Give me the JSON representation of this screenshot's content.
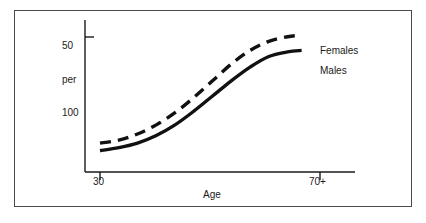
{
  "chart_data": {
    "type": "line",
    "title": "",
    "xlabel": "Age",
    "ylabel": "50 per 100",
    "ylabel_lines": [
      "50",
      "per",
      "100"
    ],
    "xtick_labels": [
      "30",
      "70+"
    ],
    "ytick_labels": [
      "50 per 100"
    ],
    "grid": false,
    "legend_position": "right-inline",
    "xlim": [
      30,
      75
    ],
    "ylim": [
      0,
      100
    ],
    "annotations": [
      "Y axis marked at 50 per 100 with a single tick",
      "Curves rise in an S-shape from age 30 to 70+",
      "Females curve lies above Males curve at every age"
    ],
    "series": [
      {
        "name": "Females",
        "style": "dashed",
        "color": "#111111",
        "x": [
          30,
          34,
          38,
          42,
          46,
          50,
          54,
          58,
          62,
          66,
          70,
          73
        ],
        "values": [
          19,
          21,
          25,
          31,
          39,
          49,
          60,
          71,
          80,
          86,
          89,
          90
        ]
      },
      {
        "name": "Males",
        "style": "solid",
        "color": "#111111",
        "x": [
          30,
          34,
          38,
          42,
          46,
          50,
          54,
          58,
          62,
          66,
          70,
          73
        ],
        "values": [
          14,
          16,
          19,
          24,
          31,
          40,
          50,
          60,
          69,
          76,
          79,
          80
        ]
      }
    ]
  },
  "axes": {
    "y_label_lines": {
      "line1": "50",
      "line2": "per",
      "line3": "100"
    },
    "x_tick_left": "30",
    "x_tick_right": "70+",
    "x_title": "Age"
  },
  "legend": {
    "females_label": "Females",
    "males_label": "Males"
  },
  "colors": {
    "line": "#111111",
    "frame": "#4a4a4a",
    "text": "#1a1a1a",
    "background": "#ffffff"
  }
}
